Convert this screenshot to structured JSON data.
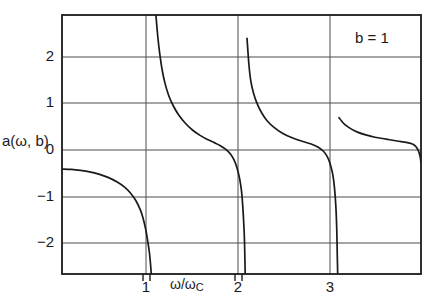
{
  "chart_data": {
    "type": "line",
    "title": "",
    "subtitle": "",
    "xlabel": "ω/ωC",
    "xlabel_base": "ω/ω",
    "xlabel_sub": "C",
    "ylabel": "a(ω, b)",
    "annotations": [
      {
        "text": "b = 1",
        "x": 3.55,
        "y": 2.45
      }
    ],
    "legend": null,
    "legend_position": "none",
    "grid": true,
    "xlim": [
      0,
      3.9
    ],
    "ylim": [
      -2.8,
      2.75
    ],
    "xticks": [
      1,
      2,
      3
    ],
    "xtick_labels": [
      "1",
      "2",
      "3"
    ],
    "yticks": [
      2,
      1,
      0,
      -1,
      -2
    ],
    "ytick_labels": [
      "2",
      "1",
      "0",
      "−1",
      "−2"
    ],
    "asymptotes": [
      1,
      2,
      3
    ],
    "series": [
      {
        "name": "a(ω, b), b = 1",
        "color": "#1a1a1a",
        "description": "Cotangent-like response with simple poles at ω/ωC = 1, 2, 3; each branch starts near a finite positive value just right of a pole, decays toward 0, then plunges to −∞ at the next pole.",
        "branches": [
          {
            "x_range": [
              0,
              1
            ],
            "points": [
              [
                0.0,
                -0.55
              ],
              [
                0.1,
                -0.56
              ],
              [
                0.2,
                -0.58
              ],
              [
                0.3,
                -0.61
              ],
              [
                0.4,
                -0.66
              ],
              [
                0.5,
                -0.73
              ],
              [
                0.6,
                -0.83
              ],
              [
                0.68,
                -0.94
              ],
              [
                0.75,
                -1.08
              ],
              [
                0.8,
                -1.22
              ],
              [
                0.85,
                -1.42
              ],
              [
                0.88,
                -1.6
              ],
              [
                0.91,
                -1.85
              ],
              [
                0.93,
                -2.08
              ],
              [
                0.95,
                -2.35
              ],
              [
                0.96,
                -2.55
              ],
              [
                0.97,
                -2.8
              ]
            ]
          },
          {
            "x_range": [
              1,
              2
            ],
            "points": [
              [
                1.02,
                2.75
              ],
              [
                1.04,
                2.3
              ],
              [
                1.06,
                1.95
              ],
              [
                1.09,
                1.55
              ],
              [
                1.12,
                1.28
              ],
              [
                1.16,
                1.02
              ],
              [
                1.21,
                0.8
              ],
              [
                1.27,
                0.6
              ],
              [
                1.34,
                0.43
              ],
              [
                1.42,
                0.28
              ],
              [
                1.5,
                0.17
              ],
              [
                1.58,
                0.08
              ],
              [
                1.66,
                0.01
              ],
              [
                1.72,
                -0.05
              ],
              [
                1.78,
                -0.13
              ],
              [
                1.83,
                -0.23
              ],
              [
                1.87,
                -0.36
              ],
              [
                1.9,
                -0.52
              ],
              [
                1.93,
                -0.76
              ],
              [
                1.95,
                -1.02
              ],
              [
                1.96,
                -1.25
              ],
              [
                1.97,
                -1.55
              ],
              [
                1.98,
                -1.95
              ],
              [
                1.985,
                -2.3
              ],
              [
                1.99,
                -2.8
              ]
            ]
          },
          {
            "x_range": [
              2,
              3
            ],
            "points": [
              [
                2.01,
                2.25
              ],
              [
                2.03,
                1.7
              ],
              [
                2.05,
                1.35
              ],
              [
                2.08,
                1.08
              ],
              [
                2.12,
                0.85
              ],
              [
                2.17,
                0.65
              ],
              [
                2.23,
                0.48
              ],
              [
                2.31,
                0.33
              ],
              [
                2.4,
                0.21
              ],
              [
                2.5,
                0.12
              ],
              [
                2.6,
                0.05
              ],
              [
                2.7,
                -0.01
              ],
              [
                2.78,
                -0.08
              ],
              [
                2.84,
                -0.17
              ],
              [
                2.88,
                -0.28
              ],
              [
                2.91,
                -0.42
              ],
              [
                2.94,
                -0.65
              ],
              [
                2.96,
                -0.95
              ],
              [
                2.975,
                -1.35
              ],
              [
                2.985,
                -1.85
              ],
              [
                2.99,
                -2.35
              ],
              [
                2.995,
                -2.8
              ]
            ]
          },
          {
            "x_range": [
              3,
              3.9
            ],
            "points": [
              [
                3.01,
                0.55
              ],
              [
                3.04,
                0.47
              ],
              [
                3.08,
                0.39
              ],
              [
                3.14,
                0.31
              ],
              [
                3.21,
                0.24
              ],
              [
                3.3,
                0.18
              ],
              [
                3.4,
                0.13
              ],
              [
                3.52,
                0.09
              ],
              [
                3.64,
                0.05
              ],
              [
                3.74,
                0.02
              ],
              [
                3.8,
                -0.01
              ],
              [
                3.84,
                -0.06
              ],
              [
                3.87,
                -0.15
              ],
              [
                3.89,
                -0.28
              ],
              [
                3.9,
                -0.42
              ]
            ]
          }
        ]
      }
    ]
  },
  "axes": {
    "y_title": "a(ω, b)",
    "x_title_base": "ω/ω",
    "x_title_sub": "C",
    "x_tick_1": "1",
    "x_tick_2": "2",
    "x_tick_3": "3",
    "y_tick_p2": "2",
    "y_tick_p1": "1",
    "y_tick_0": "0",
    "y_tick_n1": "−1",
    "y_tick_n2": "−2"
  },
  "annotation": {
    "b_value": "b = 1"
  },
  "colors": {
    "curve": "#1a1a1a",
    "frame": "#1a1a1a",
    "grid": "#4d4d4d",
    "background": "#ffffff",
    "text": "#1a1a1a"
  }
}
